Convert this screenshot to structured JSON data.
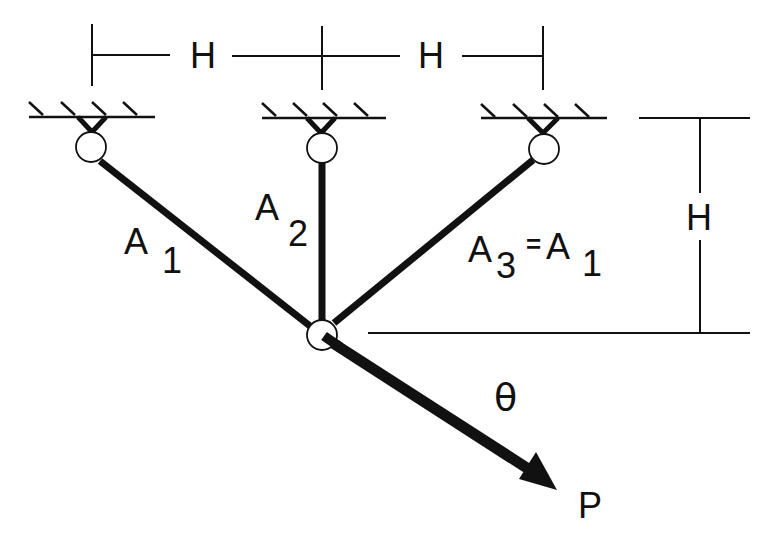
{
  "diagram": {
    "type": "three-bar truss",
    "labels": {
      "top_dim_left": "H",
      "top_dim_right": "H",
      "right_dim": "H",
      "bar1_main": "A",
      "bar1_sub": "1",
      "bar2_main": "A",
      "bar2_sub": "2",
      "bar3_main": "A",
      "bar3_sub": "3",
      "bar3_eq": "=",
      "bar3_eq_main": "A",
      "bar3_eq_sub": "1",
      "angle": "θ",
      "load": "P"
    },
    "colors": {
      "ink": "#111111",
      "background": "#ffffff"
    }
  }
}
